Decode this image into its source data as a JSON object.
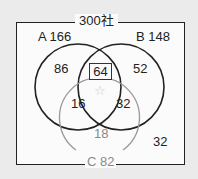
{
  "diagram": {
    "type": "venn",
    "total_label": "300社",
    "sets": [
      {
        "name": "A",
        "total": "166",
        "label": "A 166"
      },
      {
        "name": "B",
        "total": "148",
        "label": "B 148"
      },
      {
        "name": "C",
        "total": "82",
        "label": "C 82"
      }
    ],
    "regions": {
      "a_only": "86",
      "b_only": "52",
      "ab_only": "64",
      "ac_only": "16",
      "bc_only": "32",
      "c_only": "18",
      "abc": "☆",
      "none": "32"
    },
    "colors": {
      "ab_circles": "#222222",
      "c_circle": "#9a9a9a",
      "star": "#c8c8c8"
    }
  }
}
